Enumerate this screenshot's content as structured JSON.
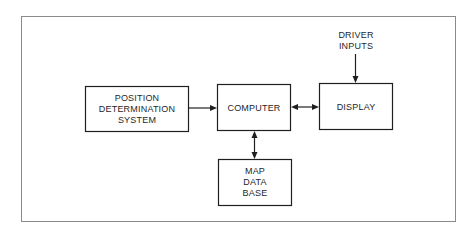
{
  "diagram": {
    "type": "block-diagram",
    "blocks": [
      {
        "id": "position",
        "lines": [
          "POSITION",
          "DETERMINATION",
          "SYSTEM"
        ]
      },
      {
        "id": "computer",
        "lines": [
          "COMPUTER"
        ]
      },
      {
        "id": "display",
        "lines": [
          "DISPLAY"
        ]
      },
      {
        "id": "map",
        "lines": [
          "MAP",
          "DATA",
          "BASE"
        ]
      }
    ],
    "external_input": {
      "id": "driver-inputs",
      "lines": [
        "DRIVER",
        "INPUTS"
      ]
    },
    "connections": [
      {
        "from": "position",
        "to": "computer",
        "direction": "one-way"
      },
      {
        "from": "computer",
        "to": "display",
        "direction": "two-way"
      },
      {
        "from": "computer",
        "to": "map",
        "direction": "two-way"
      },
      {
        "from": "driver-inputs",
        "to": "display",
        "direction": "one-way"
      }
    ]
  }
}
